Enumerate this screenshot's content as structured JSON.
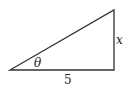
{
  "diagram": {
    "type": "right-triangle",
    "vertices": {
      "bottom_left": [
        10,
        70
      ],
      "bottom_right": [
        114,
        70
      ],
      "top_right": [
        114,
        10
      ]
    },
    "stroke_color": "#333333",
    "labels": {
      "angle": "θ",
      "opposite_side": "x",
      "adjacent_side": "5"
    }
  }
}
